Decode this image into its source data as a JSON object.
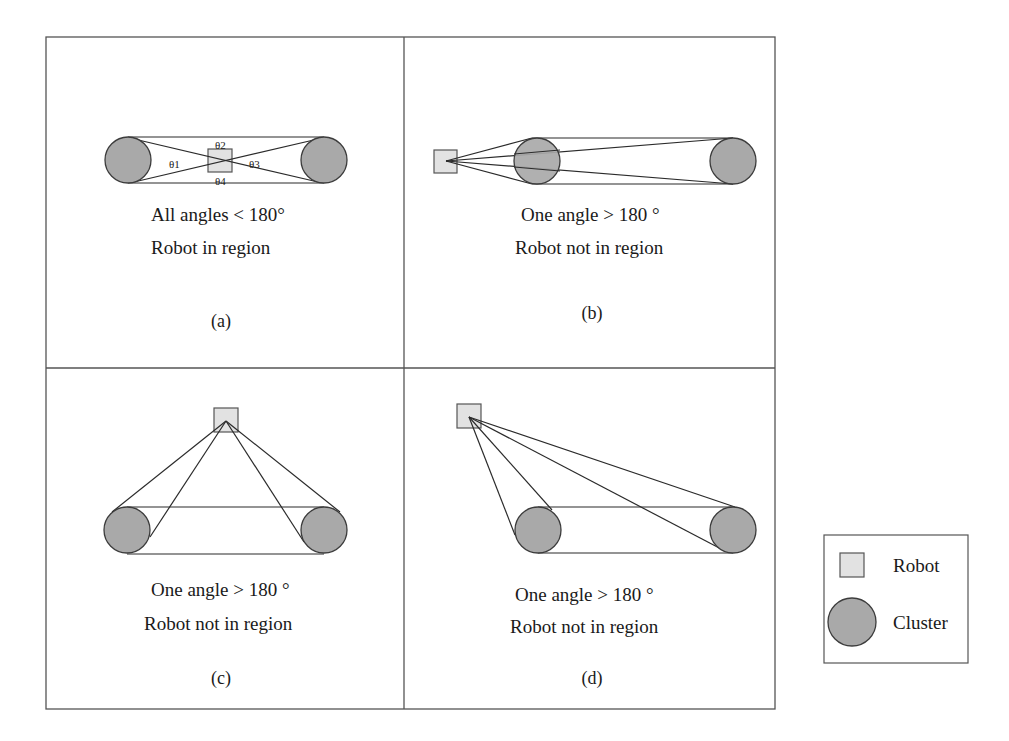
{
  "figure": {
    "panels": [
      {
        "id": "a",
        "label": "(a)",
        "line1": "All angles < 180°",
        "line2": "Robot in region",
        "angles": [
          "θ1",
          "θ2",
          "θ3",
          "θ4"
        ]
      },
      {
        "id": "b",
        "label": "(b)",
        "line1": "One angle > 180 °",
        "line2": "Robot not in region"
      },
      {
        "id": "c",
        "label": "(c)",
        "line1": "One angle > 180 °",
        "line2": "Robot not in region"
      },
      {
        "id": "d",
        "label": "(d)",
        "line1": "One angle > 180 °",
        "line2": "Robot not in region"
      }
    ],
    "legend": {
      "robot_label": "Robot",
      "cluster_label": "Cluster"
    },
    "colors": {
      "robot_fill": "#e2e2e2",
      "cluster_fill": "#a9a9a9",
      "stroke": "#2b2b2b"
    }
  }
}
